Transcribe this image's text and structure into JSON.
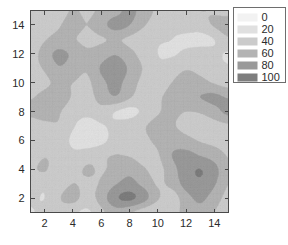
{
  "figure": {
    "background": "#ffffff",
    "width": 288,
    "height": 245
  },
  "chart_data": {
    "type": "heatmap",
    "subtype": "filled-contour",
    "title": "",
    "subtitle": "",
    "xlabel": "",
    "ylabel": "",
    "xlim": [
      1,
      15
    ],
    "ylim": [
      1,
      15
    ],
    "xticks": [
      2,
      4,
      6,
      8,
      10,
      12,
      14
    ],
    "yticks": [
      2,
      4,
      6,
      8,
      10,
      12,
      14
    ],
    "xtick_labels": [
      "2",
      "4",
      "6",
      "8",
      "10",
      "12",
      "14"
    ],
    "ytick_labels": [
      "2",
      "4",
      "6",
      "8",
      "10",
      "12",
      "14"
    ],
    "grid": false,
    "colormap": "gray-reversed",
    "levels": [
      0,
      20,
      40,
      60,
      80,
      100
    ],
    "level_colors": [
      "#f2f2f2",
      "#e0e0e0",
      "#cbcbcb",
      "#b3b3b3",
      "#9a9a9a",
      "#7e7e7e"
    ],
    "zlim": [
      0,
      120
    ],
    "legend": {
      "position": "upper-right-outside",
      "border_color": "#6e6e6e",
      "entries": [
        {
          "label": "0",
          "color": "#f2f2f2"
        },
        {
          "label": "20",
          "color": "#e0e0e0"
        },
        {
          "label": "40",
          "color": "#cbcbcb"
        },
        {
          "label": "60",
          "color": "#b3b3b3"
        },
        {
          "label": "80",
          "color": "#9a9a9a"
        },
        {
          "label": "100",
          "color": "#7e7e7e"
        }
      ]
    },
    "grid_nx": 15,
    "grid_ny": 15,
    "z": [
      [
        38,
        46,
        52,
        44,
        36,
        55,
        70,
        62,
        48,
        40,
        52,
        66,
        74,
        60,
        46
      ],
      [
        44,
        40,
        58,
        66,
        52,
        68,
        96,
        104,
        88,
        62,
        50,
        72,
        84,
        70,
        52
      ],
      [
        50,
        44,
        50,
        60,
        56,
        62,
        78,
        86,
        74,
        58,
        66,
        88,
        96,
        82,
        60
      ],
      [
        56,
        62,
        46,
        52,
        62,
        58,
        66,
        74,
        62,
        54,
        72,
        92,
        100,
        86,
        64
      ],
      [
        48,
        58,
        54,
        44,
        50,
        56,
        60,
        58,
        52,
        58,
        80,
        86,
        78,
        70,
        58
      ],
      [
        40,
        46,
        50,
        36,
        28,
        34,
        48,
        52,
        56,
        64,
        70,
        66,
        58,
        54,
        50
      ],
      [
        46,
        52,
        58,
        42,
        30,
        38,
        44,
        50,
        58,
        66,
        62,
        54,
        48,
        52,
        56
      ],
      [
        66,
        74,
        62,
        50,
        46,
        52,
        40,
        34,
        44,
        58,
        64,
        60,
        62,
        72,
        86
      ],
      [
        58,
        66,
        70,
        58,
        52,
        68,
        78,
        62,
        50,
        56,
        68,
        74,
        80,
        84,
        78
      ],
      [
        50,
        56,
        64,
        60,
        56,
        74,
        86,
        70,
        54,
        48,
        60,
        70,
        66,
        58,
        50
      ],
      [
        54,
        62,
        78,
        70,
        62,
        82,
        94,
        76,
        58,
        44,
        50,
        58,
        54,
        46,
        42
      ],
      [
        48,
        70,
        84,
        76,
        64,
        70,
        78,
        66,
        52,
        40,
        38,
        44,
        50,
        44,
        38
      ],
      [
        42,
        58,
        66,
        62,
        54,
        58,
        62,
        56,
        46,
        42,
        40,
        36,
        32,
        40,
        56
      ],
      [
        46,
        50,
        58,
        68,
        60,
        72,
        88,
        80,
        62,
        50,
        44,
        48,
        52,
        62,
        74
      ],
      [
        52,
        46,
        50,
        62,
        56,
        64,
        72,
        86,
        70,
        56,
        48,
        54,
        60,
        58,
        50
      ]
    ]
  }
}
